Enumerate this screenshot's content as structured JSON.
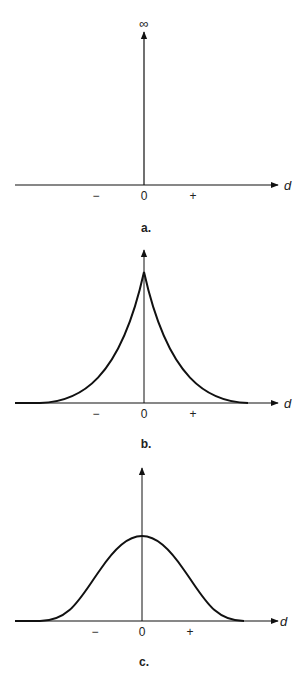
{
  "figure": {
    "panels": [
      {
        "id": "a",
        "caption": "a.",
        "top_label": "∞",
        "axis_label": "d",
        "tick_labels": {
          "minus": "−",
          "zero": "0",
          "plus": "+"
        },
        "curve": "delta spike (infinite at d = 0)"
      },
      {
        "id": "b",
        "caption": "b.",
        "axis_label": "d",
        "tick_labels": {
          "minus": "−",
          "zero": "0",
          "plus": "+"
        },
        "curve": "cusped peak (exponential decay on both sides)"
      },
      {
        "id": "c",
        "caption": "c.",
        "axis_label": "d",
        "tick_labels": {
          "minus": "−",
          "zero": "0",
          "plus": "+"
        },
        "curve": "smooth bell-shaped (Gaussian-like) curve"
      }
    ]
  },
  "colors": {
    "line": "#111111",
    "background": "#ffffff"
  }
}
